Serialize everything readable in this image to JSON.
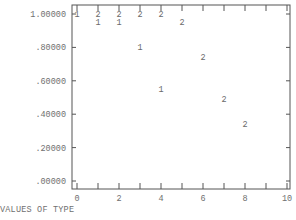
{
  "chart_data": {
    "type": "scatter",
    "title": "",
    "xlabel": "VALUES OF TYPE",
    "ylabel": "",
    "xlim": [
      0,
      10
    ],
    "ylim": [
      0,
      1.0
    ],
    "x_ticks": [
      "0",
      "2",
      "4",
      "6",
      "8",
      "10"
    ],
    "x_minor_ticks": [
      0,
      1,
      2,
      3,
      4,
      5,
      6,
      7,
      8,
      9,
      10
    ],
    "y_ticks": [
      "1.00000",
      ".80000",
      ".60000",
      ".40000",
      ".20000",
      ".00000"
    ],
    "grid": false,
    "legend": null,
    "series": [
      {
        "name": "1",
        "marker": "1",
        "points": [
          {
            "x": 0,
            "y": 1.0
          },
          {
            "x": 1,
            "y": 0.95
          },
          {
            "x": 2,
            "y": 0.95
          },
          {
            "x": 3,
            "y": 0.8
          },
          {
            "x": 4,
            "y": 0.55
          }
        ]
      },
      {
        "name": "2",
        "marker": "2",
        "points": [
          {
            "x": 1,
            "y": 1.0
          },
          {
            "x": 2,
            "y": 1.0
          },
          {
            "x": 3,
            "y": 1.0
          },
          {
            "x": 4,
            "y": 1.0
          },
          {
            "x": 5,
            "y": 0.95
          },
          {
            "x": 6,
            "y": 0.74
          },
          {
            "x": 7,
            "y": 0.49
          },
          {
            "x": 8,
            "y": 0.34
          }
        ]
      }
    ]
  },
  "labels": {
    "xlabel": "VALUES OF TYPE"
  },
  "colors": {
    "axis": "#555555",
    "text": "#6a6a6a"
  }
}
